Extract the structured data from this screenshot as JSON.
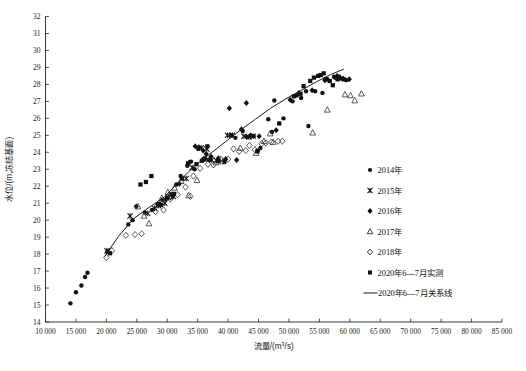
{
  "chart_data": {
    "type": "scatter",
    "title": "",
    "xlabel": "流量/(m³/s)",
    "ylabel": "水位/(m,冻结基面)",
    "xlim": [
      10000,
      85000
    ],
    "ylim": [
      14,
      32
    ],
    "xticks": [
      10000,
      15000,
      20000,
      25000,
      30000,
      35000,
      40000,
      45000,
      50000,
      55000,
      60000,
      65000,
      70000,
      75000,
      80000,
      85000
    ],
    "xticklabels": [
      "10 000",
      "15 000",
      "20 000",
      "25 000",
      "30 000",
      "35 000",
      "40 000",
      "45 000",
      "50 000",
      "55 000",
      "60 000",
      "65 000",
      "70 000",
      "75 000",
      "80 000",
      "85 000"
    ],
    "yticks": [
      14,
      15,
      16,
      17,
      18,
      19,
      20,
      21,
      22,
      23,
      24,
      25,
      26,
      27,
      28,
      29,
      30,
      31,
      32
    ],
    "yticklabels": [
      "14",
      "15",
      "16",
      "17",
      "18",
      "19",
      "20",
      "21",
      "22",
      "23",
      "24",
      "25",
      "26",
      "27",
      "28",
      "29",
      "30",
      "31",
      "32"
    ],
    "grid": false,
    "legend_position": "right",
    "series": [
      {
        "name": "2014年",
        "marker": "filled-circle",
        "color": "#111111",
        "points": [
          [
            14100,
            15.1
          ],
          [
            15000,
            15.75
          ],
          [
            15900,
            16.15
          ],
          [
            16500,
            16.65
          ],
          [
            16900,
            16.9
          ],
          [
            23600,
            19.75
          ],
          [
            24300,
            20.0
          ],
          [
            26300,
            20.45
          ],
          [
            27500,
            20.6
          ],
          [
            28400,
            20.95
          ],
          [
            29200,
            21.2
          ],
          [
            30600,
            21.55
          ],
          [
            31500,
            22.1
          ],
          [
            32200,
            22.6
          ],
          [
            33300,
            23.2
          ],
          [
            33900,
            23.45
          ],
          [
            34500,
            23.0
          ],
          [
            35100,
            24.2
          ],
          [
            36200,
            23.65
          ],
          [
            36800,
            23.55
          ],
          [
            38500,
            23.5
          ],
          [
            40500,
            25.0
          ],
          [
            41200,
            24.85
          ],
          [
            42400,
            25.25
          ],
          [
            43100,
            24.9
          ],
          [
            44200,
            24.95
          ],
          [
            44900,
            24.1
          ],
          [
            45300,
            24.25
          ],
          [
            46600,
            25.95
          ],
          [
            47200,
            25.2
          ],
          [
            47600,
            27.05
          ],
          [
            49100,
            26.0
          ],
          [
            50600,
            27.0
          ],
          [
            51300,
            27.35
          ],
          [
            52000,
            27.2
          ],
          [
            52800,
            27.6
          ],
          [
            53200,
            25.55
          ],
          [
            54300,
            27.6
          ],
          [
            55500,
            27.5
          ],
          [
            56300,
            28.3
          ],
          [
            57400,
            28.45
          ],
          [
            58600,
            28.35
          ],
          [
            59400,
            28.25
          ]
        ]
      },
      {
        "name": "2015年",
        "marker": "x-star",
        "color": "#111111",
        "points": [
          [
            20100,
            18.2
          ],
          [
            23900,
            20.25
          ],
          [
            26800,
            20.4
          ],
          [
            27900,
            20.7
          ],
          [
            28600,
            20.85
          ],
          [
            29600,
            21.0
          ],
          [
            30200,
            21.35
          ],
          [
            31000,
            21.4
          ],
          [
            33100,
            22.45
          ],
          [
            34100,
            23.1
          ],
          [
            35600,
            24.25
          ],
          [
            36500,
            24.2
          ],
          [
            37300,
            23.55
          ],
          [
            38100,
            23.5
          ],
          [
            39900,
            25.0
          ],
          [
            40700,
            25.0
          ],
          [
            42600,
            24.95
          ],
          [
            43400,
            24.9
          ],
          [
            44100,
            24.95
          ]
        ]
      },
      {
        "name": "2016年",
        "marker": "filled-diamond",
        "color": "#111111",
        "points": [
          [
            24900,
            20.8
          ],
          [
            28800,
            20.95
          ],
          [
            29800,
            21.25
          ],
          [
            30900,
            21.4
          ],
          [
            32000,
            22.15
          ],
          [
            33600,
            23.4
          ],
          [
            34600,
            24.35
          ],
          [
            35200,
            24.3
          ],
          [
            35900,
            24.1
          ],
          [
            36400,
            23.9
          ],
          [
            37200,
            23.75
          ],
          [
            38400,
            23.65
          ],
          [
            39600,
            23.6
          ],
          [
            40200,
            26.6
          ],
          [
            41400,
            23.55
          ],
          [
            42200,
            25.35
          ],
          [
            43000,
            26.9
          ],
          [
            43700,
            25.0
          ],
          [
            45100,
            24.95
          ],
          [
            47900,
            25.3
          ],
          [
            50200,
            27.1
          ],
          [
            51600,
            27.5
          ],
          [
            53800,
            27.65
          ],
          [
            55900,
            28.25
          ],
          [
            57900,
            28.5
          ],
          [
            58900,
            28.35
          ],
          [
            59900,
            28.3
          ]
        ]
      },
      {
        "name": "2017年",
        "marker": "open-triangle",
        "color": "#333333",
        "points": [
          [
            25200,
            20.8
          ],
          [
            26200,
            20.25
          ],
          [
            27000,
            19.8
          ],
          [
            29100,
            21.3
          ],
          [
            30100,
            21.65
          ],
          [
            31200,
            21.9
          ],
          [
            32300,
            22.3
          ],
          [
            33500,
            21.45
          ],
          [
            34900,
            22.35
          ],
          [
            36100,
            23.6
          ],
          [
            38000,
            23.4
          ],
          [
            39100,
            23.45
          ],
          [
            42000,
            24.25
          ],
          [
            44600,
            23.95
          ],
          [
            45900,
            24.65
          ],
          [
            46900,
            25.1
          ],
          [
            47400,
            24.6
          ],
          [
            53900,
            25.15
          ],
          [
            56300,
            26.5
          ],
          [
            59200,
            27.4
          ],
          [
            60100,
            27.35
          ],
          [
            60800,
            27.05
          ],
          [
            61900,
            27.45
          ]
        ]
      },
      {
        "name": "2018年",
        "marker": "open-diamond",
        "color": "#333333",
        "points": [
          [
            20000,
            17.8
          ],
          [
            20900,
            18.2
          ],
          [
            23200,
            19.1
          ],
          [
            24700,
            19.15
          ],
          [
            25800,
            19.2
          ],
          [
            28100,
            20.5
          ],
          [
            29400,
            20.6
          ],
          [
            30500,
            21.25
          ],
          [
            31700,
            21.5
          ],
          [
            33000,
            21.95
          ],
          [
            33800,
            21.4
          ],
          [
            34300,
            22.6
          ],
          [
            35400,
            23.05
          ],
          [
            36700,
            23.3
          ],
          [
            37600,
            23.25
          ],
          [
            38800,
            23.6
          ],
          [
            40000,
            23.6
          ],
          [
            40900,
            24.2
          ],
          [
            41800,
            24.05
          ],
          [
            42900,
            24.1
          ],
          [
            43500,
            24.4
          ],
          [
            44400,
            24.15
          ],
          [
            45500,
            24.5
          ],
          [
            46200,
            24.55
          ],
          [
            47100,
            24.6
          ],
          [
            48200,
            24.65
          ],
          [
            48900,
            24.65
          ]
        ]
      },
      {
        "name": "2020年6—7月实测",
        "marker": "filled-square",
        "color": "#111111",
        "points": [
          [
            20200,
            18.15
          ],
          [
            20600,
            18.05
          ],
          [
            25600,
            22.1
          ],
          [
            26500,
            22.25
          ],
          [
            27400,
            22.6
          ],
          [
            29000,
            20.9
          ],
          [
            30000,
            21.3
          ],
          [
            31100,
            21.55
          ],
          [
            32400,
            22.45
          ],
          [
            33400,
            23.35
          ],
          [
            34800,
            23.3
          ],
          [
            35700,
            23.5
          ],
          [
            36000,
            23.6
          ],
          [
            36600,
            24.35
          ],
          [
            37000,
            23.55
          ],
          [
            38300,
            23.5
          ],
          [
            39400,
            23.45
          ],
          [
            44800,
            24.05
          ],
          [
            48400,
            25.7
          ],
          [
            50800,
            27.3
          ],
          [
            51900,
            27.45
          ],
          [
            52400,
            27.9
          ],
          [
            53500,
            28.2
          ],
          [
            54100,
            28.4
          ],
          [
            54800,
            28.5
          ],
          [
            55200,
            28.55
          ],
          [
            55700,
            28.65
          ],
          [
            56000,
            28.3
          ],
          [
            56700,
            28.2
          ],
          [
            57200,
            27.95
          ],
          [
            57700,
            28.4
          ],
          [
            58200,
            28.45
          ],
          [
            58000,
            28.3
          ],
          [
            59000,
            28.3
          ]
        ]
      }
    ],
    "fit_line": {
      "name": "2020年6—7月关系线",
      "color": "#1a1a1a",
      "points": [
        [
          19700,
          17.85
        ],
        [
          22000,
          19.05
        ],
        [
          24500,
          20.1
        ],
        [
          27000,
          20.75
        ],
        [
          29500,
          21.35
        ],
        [
          32000,
          22.3
        ],
        [
          34500,
          23.2
        ],
        [
          37000,
          23.9
        ],
        [
          39500,
          24.6
        ],
        [
          42000,
          25.3
        ],
        [
          44500,
          25.95
        ],
        [
          47000,
          26.6
        ],
        [
          49500,
          27.15
        ],
        [
          52000,
          27.65
        ],
        [
          54500,
          28.15
        ],
        [
          57000,
          28.6
        ],
        [
          59000,
          28.9
        ]
      ]
    }
  },
  "legend": {
    "items": [
      {
        "label": "2014年",
        "marker": "filled-circle"
      },
      {
        "label": "2015年",
        "marker": "x-star"
      },
      {
        "label": "2016年",
        "marker": "filled-diamond"
      },
      {
        "label": "2017年",
        "marker": "open-triangle"
      },
      {
        "label": "2018年",
        "marker": "open-diamond"
      },
      {
        "label": "2020年6—7月实测",
        "marker": "filled-square"
      },
      {
        "label": "2020年6—7月关系线",
        "marker": "line"
      }
    ]
  },
  "axes": {
    "x_title_main": "流量/(m",
    "x_title_sup": "3",
    "x_title_tail": "/s)",
    "y_title": "水位/(m,冻结基面)"
  }
}
